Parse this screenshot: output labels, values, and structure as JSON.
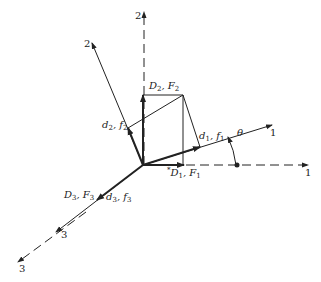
{
  "figure": {
    "angle_label": "θ",
    "axes": {
      "global_1_label": "1",
      "global_2_label": "2",
      "global_3_label": "3",
      "local_1_label": "1",
      "local_2_label": "2",
      "local_3_label": "3"
    },
    "vectors": {
      "D1F1": {
        "main": "D",
        "sub1": "1",
        "sep": ", ",
        "main2": "F",
        "sub2": "1",
        "prefix": "*"
      },
      "D2F2": {
        "main": "D",
        "sub1": "2",
        "sep": ", ",
        "main2": "F",
        "sub2": "2"
      },
      "D3F3": {
        "main": "D",
        "sub1": "3",
        "sep": ", ",
        "main2": "F",
        "sub2": "3"
      },
      "d1f1": {
        "main": "d",
        "sub1": "1",
        "sep": ", ",
        "main2": "f",
        "sub2": "1"
      },
      "d2f2": {
        "main": "d",
        "sub1": "2",
        "sep": ", ",
        "main2": "f",
        "sub2": "2"
      },
      "d3f3": {
        "main": "d",
        "sub1": "3",
        "sep": ", ",
        "main2": "f",
        "sub2": "3"
      }
    },
    "colors": {
      "line": "#222222",
      "background": "#ffffff"
    }
  }
}
